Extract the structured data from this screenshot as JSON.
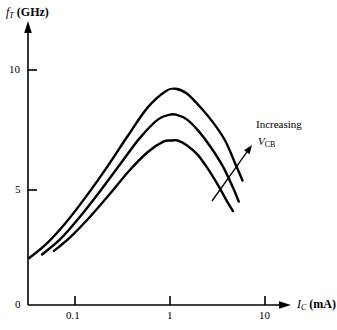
{
  "chart_data": {
    "type": "line",
    "title": "",
    "xlabel": "I_C (mA)",
    "ylabel": "f_T (GHz)",
    "xscale": "log",
    "xlim": [
      0.03,
      13
    ],
    "ylim": [
      0,
      12
    ],
    "grid": false,
    "legend": "none",
    "xticks": [
      0.1,
      1,
      10
    ],
    "xticklabels": [
      "0.1",
      "1",
      "10"
    ],
    "yticks": [
      0,
      5,
      10
    ],
    "yticklabels": [
      "0",
      "5",
      "10"
    ],
    "series": [
      {
        "name": "curve-top-highest-VCB",
        "x": [
          0.033,
          0.05,
          0.08,
          0.13,
          0.22,
          0.36,
          0.58,
          0.9,
          1.15,
          1.5,
          2.0,
          2.8,
          3.8,
          5.0,
          5.8
        ],
        "y": [
          2.0,
          2.6,
          3.5,
          4.6,
          5.9,
          7.2,
          8.4,
          9.1,
          9.2,
          9.0,
          8.5,
          7.8,
          7.0,
          5.9,
          5.3
        ]
      },
      {
        "name": "curve-middle",
        "x": [
          0.045,
          0.07,
          0.11,
          0.18,
          0.3,
          0.48,
          0.75,
          1.0,
          1.15,
          1.5,
          2.0,
          2.7,
          3.6,
          4.6,
          5.3
        ],
        "y": [
          2.15,
          2.8,
          3.7,
          4.8,
          6.0,
          7.1,
          7.9,
          8.1,
          8.1,
          7.9,
          7.4,
          6.7,
          5.9,
          5.0,
          4.4
        ]
      },
      {
        "name": "curve-bottom-lowest-VCB",
        "x": [
          0.06,
          0.09,
          0.14,
          0.23,
          0.37,
          0.58,
          0.85,
          1.05,
          1.2,
          1.5,
          1.95,
          2.5,
          3.2,
          4.0,
          4.6
        ],
        "y": [
          2.3,
          2.9,
          3.7,
          4.7,
          5.7,
          6.5,
          6.95,
          7.0,
          7.0,
          6.8,
          6.4,
          5.8,
          5.1,
          4.4,
          4.0
        ]
      }
    ],
    "annotations": [
      {
        "name": "increasing-vcb",
        "line1": "Increasing",
        "line2_symbol": "V",
        "line2_subscript": "CB",
        "arrow_from_x": 212,
        "arrow_from_y": 201,
        "arrow_to_x": 252,
        "arrow_to_y": 145
      }
    ],
    "axis_labels": {
      "y_symbol": "f",
      "y_subscript": "T",
      "y_unit": "(GHz)",
      "x_symbol": "I",
      "x_subscript": "C",
      "x_unit": "(mA)"
    },
    "colors": {
      "curve": "#000000",
      "axis": "#000000",
      "background": "#ffffff"
    }
  }
}
